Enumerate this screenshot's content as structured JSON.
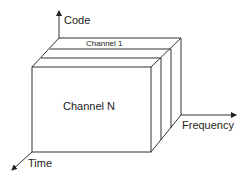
{
  "diagram": {
    "type": "3d-box-channel-partition",
    "axes": {
      "code": "Code",
      "frequency": "Frequency",
      "time": "Time"
    },
    "channels": {
      "first": "Channel 1",
      "last": "Channel N"
    },
    "colors": {
      "line": "#333333",
      "background": "#ffffff",
      "text": "#222222"
    }
  }
}
